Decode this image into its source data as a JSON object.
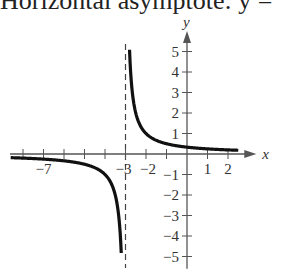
{
  "caption": "Horizontal asymptote:  y =",
  "chart_data": {
    "type": "line",
    "title": "",
    "function": "y = 1/(x+3)",
    "xlabel": "x",
    "ylabel": "y",
    "xlim": [
      -8.5,
      2.6
    ],
    "ylim": [
      -5.5,
      5.8
    ],
    "x_tick_labels": [
      "-7",
      "-3",
      "-2",
      "1",
      "2"
    ],
    "x_ticks": [
      -8,
      -7,
      -6,
      -5,
      -4,
      -3,
      -2,
      -1,
      1,
      2
    ],
    "y_tick_labels": [
      "5",
      "4",
      "3",
      "2",
      "1",
      "-1",
      "-2",
      "-3",
      "-4",
      "-5"
    ],
    "y_ticks": [
      5,
      4,
      3,
      2,
      1,
      -1,
      -2,
      -3,
      -4,
      -5
    ],
    "vertical_asymptote": -3,
    "horizontal_asymptote": 0,
    "grid": false,
    "series": [
      {
        "name": "right branch",
        "x": [
          -2.82,
          -2.8,
          -2.7,
          -2.5,
          -2,
          -1,
          0,
          1,
          2,
          2.4
        ],
        "y": [
          5.5,
          5,
          3.33,
          2,
          1,
          0.5,
          0.33,
          0.25,
          0.2,
          0.19
        ]
      },
      {
        "name": "left branch",
        "x": [
          -8.5,
          -8,
          -7,
          -6,
          -5,
          -4,
          -3.5,
          -3.3,
          -3.2,
          -3.18
        ],
        "y": [
          -0.18,
          -0.2,
          -0.25,
          -0.33,
          -0.5,
          -1,
          -2,
          -3.33,
          -5,
          -5.5
        ]
      }
    ]
  }
}
